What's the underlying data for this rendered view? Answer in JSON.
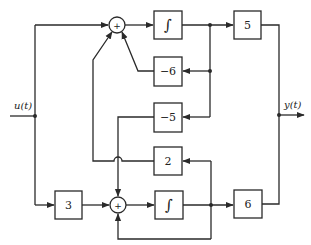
{
  "diagram": {
    "type": "block-diagram",
    "input_signal": "u(t)",
    "output_signal": "y(t)",
    "summing_junctions": {
      "top": {
        "sign": "+"
      },
      "bottom": {
        "sign": "+"
      }
    },
    "blocks": {
      "integrator_top": {
        "label": "∫"
      },
      "gain_5": {
        "label": "5"
      },
      "gain_neg6": {
        "label": "−6"
      },
      "gain_neg5": {
        "label": "−5"
      },
      "gain_2": {
        "label": "2"
      },
      "gain_3": {
        "label": "3"
      },
      "integrator_bottom": {
        "label": "∫"
      },
      "gain_6": {
        "label": "6"
      }
    },
    "colors": {
      "line": "#2a2a2a",
      "background": "#ffffff"
    }
  }
}
